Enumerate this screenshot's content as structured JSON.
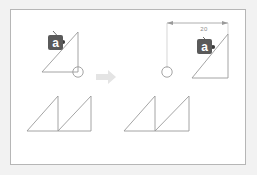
{
  "figure": {
    "background_color": "#f2f2f2",
    "panel_color": "#ffffff",
    "panel_border_color": "#b6b6b6",
    "line_color": "#9a9a9a",
    "accent_color": "#5a5a5a",
    "arrow_color": "#e2e2e2",
    "before": {
      "label_text": "a",
      "anchor_dot": "anchor-dot",
      "shape": "right-triangle",
      "circle": "reference-circle"
    },
    "after": {
      "label_text": "a",
      "anchor_dot": "anchor-dot",
      "shape": "right-triangle",
      "circle": "reference-circle",
      "dimension_value": "20"
    },
    "transition": {
      "icon": "right-arrow-icon"
    },
    "bottom_before": {
      "shape": "sawtooth-double-triangle"
    },
    "bottom_after": {
      "shape": "sawtooth-double-triangle"
    }
  }
}
